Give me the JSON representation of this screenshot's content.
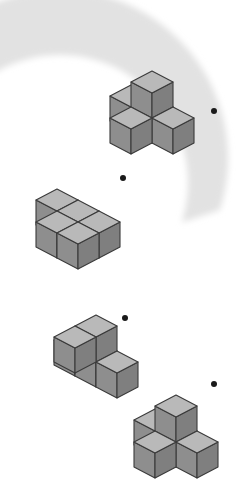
{
  "page": {
    "question_number": "11",
    "width": 243,
    "height": 484,
    "background_color": "#ffffff",
    "type": "spatial-reasoning-cube-puzzle"
  },
  "colors": {
    "arc_fill": "#e2e2e2",
    "cube_top": "#b9b9b9",
    "cube_left": "#8e8e8e",
    "cube_right": "#7f7f7f",
    "cube_edge": "#3a3a3a",
    "bullet_dot": "#1a1a1a",
    "number_ink": "#3a3a3a"
  },
  "arc": {
    "name": "crescent-arc",
    "description": "large open C-shaped gray crescent opening to the left",
    "center_x": 60,
    "center_y": 262,
    "outer_radius": 168,
    "inner_radius": 128,
    "start_angle_deg": -72,
    "end_angle_deg": 72
  },
  "options": [
    {
      "id": "option-1",
      "label": "",
      "cube_count": 5,
      "shape": "plus-with-raised-center",
      "origin_x": 152,
      "origin_y": 96,
      "cubes": [
        {
          "x": 0,
          "y": 0,
          "z": 0
        },
        {
          "x": 1,
          "y": 0,
          "z": 0
        },
        {
          "x": 0,
          "y": 1,
          "z": 0
        },
        {
          "x": -1,
          "y": 0,
          "z": 0
        },
        {
          "x": 0,
          "y": 0,
          "z": 1
        }
      ],
      "dot": {
        "x": 214,
        "y": 111,
        "r": 3.0
      }
    },
    {
      "id": "option-2",
      "label": "",
      "cube_count": 5,
      "shape": "stepped-block",
      "origin_x": 78,
      "origin_y": 200,
      "cubes": [
        {
          "x": 0,
          "y": 0,
          "z": 0
        },
        {
          "x": 1,
          "y": 0,
          "z": 0
        },
        {
          "x": 0,
          "y": 1,
          "z": 0
        },
        {
          "x": -1,
          "y": 0,
          "z": 0
        },
        {
          "x": 1,
          "y": 1,
          "z": 0
        }
      ],
      "dot": {
        "x": 123,
        "y": 178,
        "r": 3.0
      }
    },
    {
      "id": "option-3",
      "label": "",
      "cube_count": 5,
      "shape": "row-with-stacked-pair",
      "origin_x": 96,
      "origin_y": 340,
      "cubes": [
        {
          "x": 0,
          "y": 0,
          "z": 0
        },
        {
          "x": 1,
          "y": 0,
          "z": 0
        },
        {
          "x": -1,
          "y": 0,
          "z": 0
        },
        {
          "x": 0,
          "y": 0,
          "z": 1
        },
        {
          "x": 0,
          "y": 1,
          "z": 1
        }
      ],
      "dot": {
        "x": 125,
        "y": 318,
        "r": 3.0
      }
    },
    {
      "id": "option-4",
      "label": "",
      "cube_count": 5,
      "shape": "plus-with-raised-center",
      "origin_x": 176,
      "origin_y": 420,
      "cubes": [
        {
          "x": 0,
          "y": 0,
          "z": 0
        },
        {
          "x": 1,
          "y": 0,
          "z": 0
        },
        {
          "x": 0,
          "y": 1,
          "z": 0
        },
        {
          "x": -1,
          "y": 0,
          "z": 0
        },
        {
          "x": 0,
          "y": 0,
          "z": 1
        }
      ],
      "dot": {
        "x": 214,
        "y": 384,
        "r": 3.0
      }
    }
  ]
}
